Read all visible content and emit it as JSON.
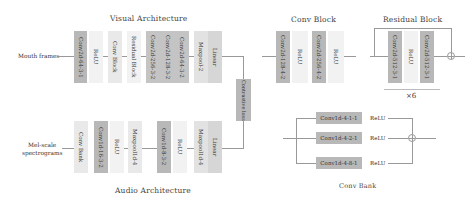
{
  "visual": {
    "title": "Visual Architecture",
    "input": "Mouth frames",
    "layers": [
      {
        "label": "Conv2d-64-3-1"
      },
      {
        "label": "ReLU"
      },
      {
        "label": "Conv Block"
      },
      {
        "label": "Residual Block"
      },
      {
        "label": "Conv2d-256-3-2"
      },
      {
        "label": "Conv2d-128-3-2"
      },
      {
        "label": "Conv2d-64-3-2"
      },
      {
        "label": "Maxpool-2"
      },
      {
        "label": "Linear"
      }
    ]
  },
  "audio": {
    "title": "Audio Architecture",
    "input_line1": "Mel-scale",
    "input_line2": "spectrograms",
    "layers": [
      {
        "label": "Conv Bank"
      },
      {
        "label": "Conv1d-16-3-2"
      },
      {
        "label": "ReLU"
      },
      {
        "label": "Maxpool1d-4"
      },
      {
        "label": "Conv1d-8-3-2"
      },
      {
        "label": "ReLU"
      },
      {
        "label": "Maxpool1d-4"
      },
      {
        "label": "Linear"
      }
    ]
  },
  "loss": {
    "label": "Contrastive loss"
  },
  "conv_block": {
    "title": "Conv Block",
    "layers": [
      {
        "label": "Conv2d-128-4-2"
      },
      {
        "label": "ReLU"
      },
      {
        "label": "Conv2d-256-4-2"
      },
      {
        "label": "ReLU"
      }
    ]
  },
  "residual_block": {
    "title": "Residual Block",
    "layers": [
      {
        "label": "Conv2d-512-3-1"
      },
      {
        "label": "ReLU"
      },
      {
        "label": "Conv2d-512-3-1"
      }
    ],
    "repeat": "×6"
  },
  "conv_bank": {
    "title": "Conv Bank",
    "rows": [
      {
        "conv": "Conv1d-4-1-1",
        "act": "ReLU"
      },
      {
        "conv": "Conv1d-4-2-1",
        "act": "ReLU"
      },
      {
        "conv": "Conv1d-4-8-1",
        "act": "ReLU"
      }
    ]
  }
}
